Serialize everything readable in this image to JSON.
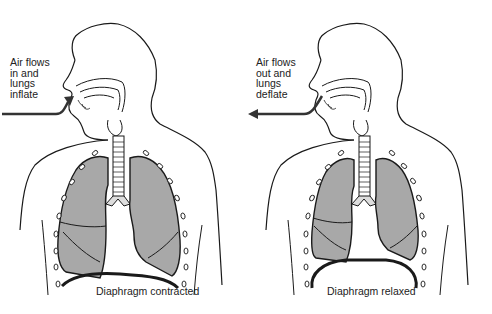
{
  "figure": {
    "panels": [
      {
        "id": "inhalation",
        "callout_lines": [
          "Air flows",
          "in and",
          "lungs",
          "inflate"
        ],
        "caption": "Diaphragm contracted",
        "arrow_direction": "inward",
        "diaphragm_state": "contracted"
      },
      {
        "id": "exhalation",
        "callout_lines": [
          "Air flows",
          "out and",
          "lungs",
          "deflate"
        ],
        "caption": "Diaphragm relaxed",
        "arrow_direction": "outward",
        "diaphragm_state": "relaxed"
      }
    ],
    "colors": {
      "outline": "#1a1a1a",
      "lung_fill": "#a8a8a8",
      "arrow": "#333333",
      "background": "#ffffff"
    }
  }
}
